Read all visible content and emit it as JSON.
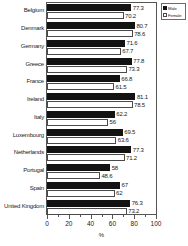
{
  "chart_data": {
    "type": "bar",
    "orientation": "horizontal",
    "title": "",
    "xlabel": "%",
    "ylabel": "",
    "xlim": [
      0,
      100
    ],
    "xticks": [
      0,
      20,
      40,
      60,
      80,
      100
    ],
    "xtick_labels": [
      "0",
      "20",
      "40",
      "60",
      "80",
      "100"
    ],
    "grid": false,
    "legend_position": "top-right",
    "categories": [
      "Belgium",
      "Denmark",
      "Germany",
      "Greece",
      "France",
      "Ireland",
      "Italy",
      "Luxembourg",
      "Netherlands",
      "Portugal",
      "Spain",
      "United Kingdom"
    ],
    "series": [
      {
        "name": "Male",
        "values": [
          77.3,
          80.7,
          71.6,
          77.8,
          66.8,
          81.1,
          62.2,
          69.5,
          77.3,
          58,
          67,
          76.3
        ],
        "labels": [
          "77.3",
          "80.7",
          "71.6",
          "77.8",
          "66.8",
          "81.1",
          "62.2",
          "69.5",
          "77.3",
          "58",
          "67",
          "76.3"
        ],
        "color": "#131313"
      },
      {
        "name": "Female",
        "values": [
          70.2,
          78.6,
          67.7,
          73.3,
          61.5,
          78.5,
          56,
          63.6,
          71.2,
          48.6,
          62,
          73.2
        ],
        "labels": [
          "70.2",
          "78.6",
          "67.7",
          "73.3",
          "61.5",
          "78.5",
          "56",
          "63.6",
          "71.2",
          "48.6",
          "62",
          "73.2"
        ],
        "color": "#ffffff"
      }
    ]
  },
  "legend": {
    "items": [
      {
        "label": "Male",
        "swatch": "male"
      },
      {
        "label": "Female",
        "swatch": "female"
      }
    ]
  }
}
